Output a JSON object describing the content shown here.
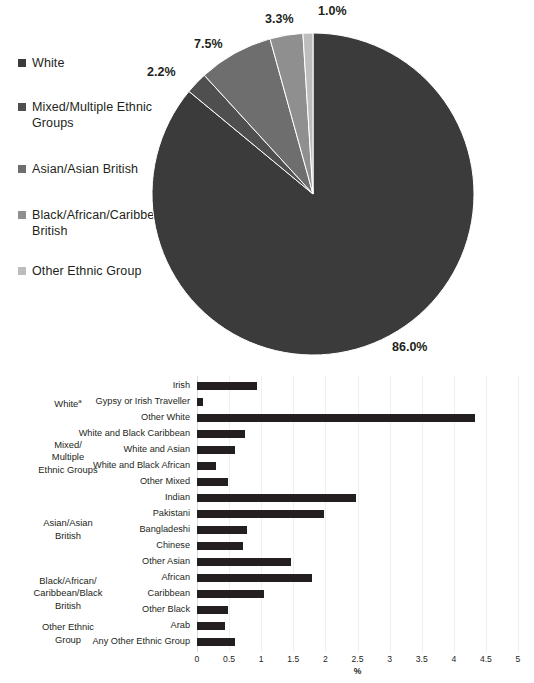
{
  "chart_data": [
    {
      "type": "pie",
      "title": "",
      "xlabel": "",
      "ylabel": "",
      "legend_position": "left",
      "categories": [
        "White",
        "Mixed/Multiple Ethnic Groups",
        "Asian/Asian British",
        "Black/African/Caribbean/Black British",
        "Other Ethnic Group"
      ],
      "values": [
        86.0,
        2.2,
        7.5,
        3.3,
        1.0
      ],
      "value_labels": [
        "86.0%",
        "2.2%",
        "7.5%",
        "3.3%",
        "1.0%"
      ],
      "colors": [
        "#3b3b3b",
        "#4f4f4f",
        "#6e6e6e",
        "#8f8f8f",
        "#bdbdbd"
      ]
    },
    {
      "type": "bar",
      "orientation": "horizontal",
      "title": "",
      "xlabel": "%",
      "ylabel": "",
      "xlim": [
        0,
        5
      ],
      "grid": true,
      "x_ticks": [
        "0",
        "0.5",
        "1",
        "1.5",
        "2",
        "2.5",
        "3",
        "3.5",
        "4",
        "4.5",
        "5"
      ],
      "x_tick_values": [
        0,
        0.5,
        1,
        1.5,
        2,
        2.5,
        3,
        3.5,
        4,
        4.5,
        5
      ],
      "bar_color": "#231f20",
      "categories": [
        "Irish",
        "Gypsy or Irish Traveller",
        "Other White",
        "White and Black Caribbean",
        "White and Asian",
        "White and Black African",
        "Other Mixed",
        "Indian",
        "Pakistani",
        "Bangladeshi",
        "Chinese",
        "Other Asian",
        "African",
        "Caribbean",
        "Other Black",
        "Arab",
        "Any Other Ethnic Group"
      ],
      "values": [
        0.94,
        0.1,
        4.33,
        0.74,
        0.59,
        0.3,
        0.49,
        2.48,
        1.98,
        0.78,
        0.72,
        1.47,
        1.79,
        1.05,
        0.49,
        0.44,
        0.59
      ],
      "groups": [
        {
          "label": "White",
          "footnote": "a",
          "start_index": 0,
          "end_index": 2
        },
        {
          "label": "Mixed/\nMultiple\nEthnic Groups",
          "start_index": 3,
          "end_index": 6
        },
        {
          "label": "Asian/Asian\nBritish",
          "start_index": 7,
          "end_index": 11
        },
        {
          "label": "Black/African/\nCaribbean/Black\nBritish",
          "start_index": 12,
          "end_index": 14
        },
        {
          "label": "Other Ethnic\nGroup",
          "start_index": 15,
          "end_index": 16
        }
      ]
    }
  ],
  "pie": {
    "legend": [
      {
        "label": "White",
        "color": "#3b3b3b"
      },
      {
        "label": "Mixed/Multiple Ethnic Groups",
        "color": "#4f4f4f"
      },
      {
        "label": "Asian/Asian British",
        "color": "#6e6e6e"
      },
      {
        "label": "Black/African/Caribbean/Black British",
        "color": "#8f8f8f"
      },
      {
        "label": "Other Ethnic Group",
        "color": "#bdbdbd"
      }
    ],
    "labels": {
      "white": "86.0%",
      "mixed": "2.2%",
      "asian": "7.5%",
      "black": "3.3%",
      "other": "1.0%"
    }
  },
  "bar": {
    "group_labels": {
      "white": "White",
      "white_footnote": "a",
      "mixed_line1": "Mixed/",
      "mixed_line2": "Multiple",
      "mixed_line3": "Ethnic Groups",
      "asian_line1": "Asian/Asian",
      "asian_line2": "British",
      "black_line1": "Black/African/",
      "black_line2": "Caribbean/Black",
      "black_line3": "British",
      "other_line1": "Other Ethnic",
      "other_line2": "Group"
    },
    "axis_title": "%"
  }
}
